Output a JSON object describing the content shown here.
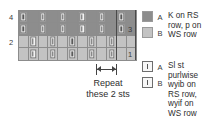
{
  "chart_data": {
    "type": "table",
    "columns": 12,
    "rows": 4,
    "row_labels_left": [
      "4",
      "2"
    ],
    "row_labels_right": [
      "3",
      "1"
    ],
    "legend_colors": {
      "A": "#8d8d8d",
      "B": "#c3c3c3"
    },
    "cells": [
      [
        "A",
        "A",
        "A",
        "A",
        "A",
        "A",
        "A",
        "A",
        "A",
        "A",
        "A",
        "A"
      ],
      [
        "A",
        "A",
        "A",
        "A",
        "A",
        "A",
        "A",
        "A",
        "A",
        "A",
        "A",
        "A"
      ],
      [
        "B",
        "B",
        "B",
        "B",
        "B",
        "B",
        "B",
        "B",
        "B",
        "B",
        "B",
        "B"
      ],
      [
        "B",
        "B",
        "B",
        "B",
        "B",
        "B",
        "B",
        "B",
        "B",
        "B",
        "B",
        "B"
      ]
    ],
    "slip_symbols": [
      [
        1,
        0,
        1,
        0,
        1,
        0,
        1,
        0,
        1,
        0,
        1,
        0
      ],
      [
        1,
        0,
        1,
        0,
        1,
        0,
        1,
        0,
        1,
        0,
        1,
        0
      ],
      [
        0,
        1,
        0,
        1,
        0,
        1,
        0,
        1,
        0,
        1,
        0,
        0
      ],
      [
        0,
        1,
        0,
        1,
        0,
        1,
        0,
        1,
        0,
        1,
        0,
        0
      ]
    ],
    "repeat_width_sts": 2,
    "repeat_caption": [
      "Repeat",
      "these 2 sts"
    ]
  },
  "chart": {
    "row_4_label": "4",
    "row_2_label": "2",
    "row_3_label": "3",
    "row_1_label": "1"
  },
  "repeat": {
    "line1": "Repeat",
    "line2": "these 2 sts"
  },
  "legend": {
    "group1": {
      "key_a": "A",
      "key_b": "B",
      "desc_line1": "K on RS",
      "desc_line2": "row, p on",
      "desc_line3": "WS row"
    },
    "group2": {
      "key_a": "A",
      "key_b": "B",
      "desc_line1": "Sl st",
      "desc_line2": "purlwise",
      "desc_line3": "wyib on",
      "desc_line4": "RS row,",
      "desc_line5": "wyif on",
      "desc_line6": "WS row"
    }
  }
}
